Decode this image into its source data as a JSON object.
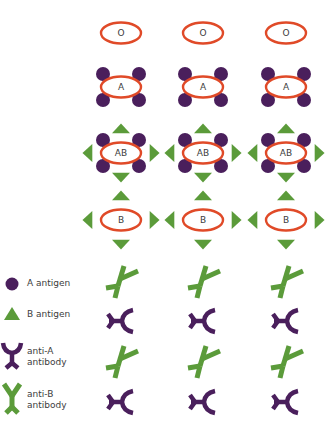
{
  "colors": {
    "membrane": "#e04a28",
    "a_antigen": "#4a1f5c",
    "b_antigen": "#5b9b3a",
    "anti_a": "#4a1f5c",
    "anti_b": "#5b9b3a",
    "text": "#3c3c3c"
  },
  "columns_x": [
    121,
    203,
    286
  ],
  "cells": [
    {
      "type": "O",
      "label": "O",
      "y": 33,
      "a_antigen": false,
      "b_antigen": false
    },
    {
      "type": "A",
      "label": "A",
      "y": 87,
      "a_antigen": true,
      "b_antigen": false
    },
    {
      "type": "AB",
      "label": "AB",
      "y": 153,
      "a_antigen": true,
      "b_antigen": true
    },
    {
      "type": "B",
      "label": "B",
      "y": 220,
      "a_antigen": false,
      "b_antigen": true
    }
  ],
  "antibody_rows": [
    {
      "kind": "anti-B",
      "y": 281
    },
    {
      "kind": "anti-A",
      "y": 321
    },
    {
      "kind": "anti-B",
      "y": 361
    },
    {
      "kind": "anti-A",
      "y": 402
    }
  ],
  "legend": {
    "items": [
      {
        "icon": "a-antigen-circle-icon",
        "label": "A antigen",
        "y": 284
      },
      {
        "icon": "b-antigen-triangle-icon",
        "label": "B antigen",
        "y": 315
      },
      {
        "icon": "anti-a-antibody-icon",
        "label_line1": "anti-A",
        "label_line2": "antibody",
        "y": 355
      },
      {
        "icon": "anti-b-antibody-icon",
        "label_line1": "anti-B",
        "label_line2": "antibody",
        "y": 398
      }
    ]
  }
}
